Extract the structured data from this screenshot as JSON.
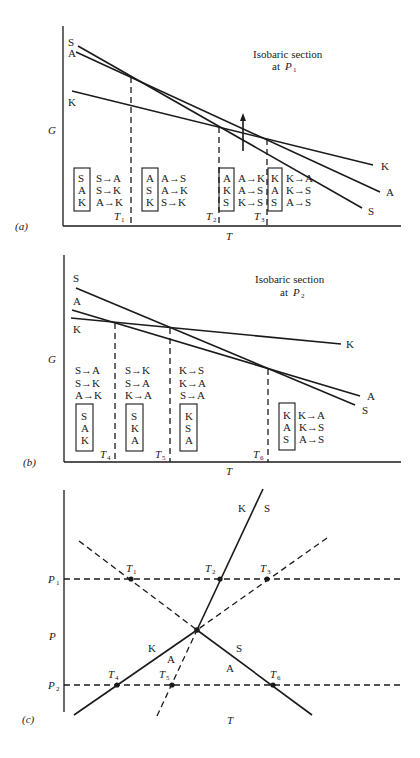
{
  "panels": {
    "a": {
      "label": "(a)",
      "y_axis": "G",
      "x_axis": "T",
      "title_line1": "Isobaric section",
      "title_line2_prefix": "at ",
      "title_line2_var": "P",
      "title_line2_sub": "1",
      "curve_labels": {
        "S_left": "S",
        "A_left": "A",
        "K_left": "K",
        "K_right": "K",
        "A_right": "A",
        "S_right": "S"
      },
      "transitions": [
        {
          "var": "T",
          "sub": "1"
        },
        {
          "var": "T",
          "sub": "2"
        },
        {
          "var": "T",
          "sub": "3"
        }
      ],
      "regions": [
        {
          "stability": [
            "S",
            "A",
            "K"
          ],
          "reactions": [
            "S→A",
            "S→K",
            "A→K"
          ]
        },
        {
          "stability": [
            "A",
            "S",
            "K"
          ],
          "reactions": [
            "A→S",
            "A→K",
            "S→K"
          ]
        },
        {
          "stability": [
            "A",
            "K",
            "S"
          ],
          "reactions": [
            "A→K",
            "A→S",
            "K→S"
          ]
        },
        {
          "stability": [
            "K",
            "A",
            "S"
          ],
          "reactions": [
            "K→A",
            "K→S",
            "A→S"
          ]
        }
      ]
    },
    "b": {
      "label": "(b)",
      "y_axis": "G",
      "x_axis": "T",
      "title_line1": "Isobaric section",
      "title_line2_prefix": "at ",
      "title_line2_var": "P",
      "title_line2_sub": "2",
      "curve_labels": {
        "S_left": "S",
        "A_left": "A",
        "K_left": "K",
        "K_right": "K",
        "A_right": "A",
        "S_right": "S"
      },
      "transitions": [
        {
          "var": "T",
          "sub": "4"
        },
        {
          "var": "T",
          "sub": "5"
        },
        {
          "var": "T",
          "sub": "6"
        }
      ],
      "regions": [
        {
          "stability": [
            "S",
            "A",
            "K"
          ],
          "reactions": [
            "S→A",
            "S→K",
            "A→K"
          ]
        },
        {
          "stability": [
            "S",
            "K",
            "A"
          ],
          "reactions": [
            "S→K",
            "S→A",
            "K→A"
          ]
        },
        {
          "stability": [
            "K",
            "S",
            "A"
          ],
          "reactions": [
            "K→S",
            "K→A",
            "S→A"
          ]
        },
        {
          "stability": [
            "K",
            "A",
            "S"
          ],
          "reactions": [
            "K→A",
            "K→S",
            "A→S"
          ]
        }
      ]
    },
    "c": {
      "label": "(c)",
      "y_axis": "P",
      "x_axis": "T",
      "pressures": [
        {
          "var": "P",
          "sub": "1"
        },
        {
          "var": "P",
          "sub": "2"
        }
      ],
      "points": [
        {
          "var": "T",
          "sub": "1"
        },
        {
          "var": "T",
          "sub": "2"
        },
        {
          "var": "T",
          "sub": "3"
        },
        {
          "var": "T",
          "sub": "4"
        },
        {
          "var": "T",
          "sub": "5"
        },
        {
          "var": "T",
          "sub": "6"
        }
      ],
      "field_labels": {
        "upper_K": "K",
        "upper_S": "S",
        "lower_K": "K",
        "lower_A_left": "A",
        "lower_S": "S",
        "lower_A_right": "A"
      }
    }
  }
}
